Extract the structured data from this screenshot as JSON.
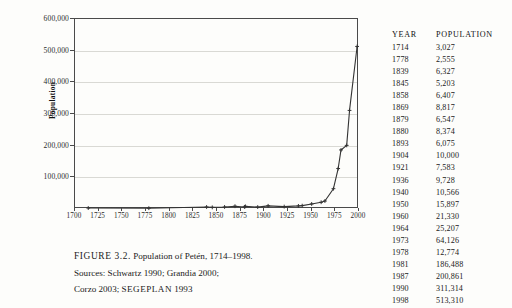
{
  "figure": {
    "caption_figno": "FIGURE 3.2.",
    "caption_title": "Population of Petén, 1714–1998.",
    "caption_line2": "Sources: Schwartz 1990; Grandia 2000;",
    "caption_line3_a": "Corzo 2003; ",
    "caption_line3_b": "SEGEPLAN",
    "caption_line3_c": " 1993"
  },
  "table": {
    "header_year": "YEAR",
    "header_population": "POPULATION",
    "rows": [
      {
        "year": "1714",
        "population": "3,027"
      },
      {
        "year": "1778",
        "population": "2,555"
      },
      {
        "year": "1839",
        "population": "6,327"
      },
      {
        "year": "1845",
        "population": "5,203"
      },
      {
        "year": "1858",
        "population": "6,407"
      },
      {
        "year": "1869",
        "population": "8,817"
      },
      {
        "year": "1879",
        "population": "6,547"
      },
      {
        "year": "1880",
        "population": "8,374"
      },
      {
        "year": "1893",
        "population": "6,075"
      },
      {
        "year": "1904",
        "population": "10,000"
      },
      {
        "year": "1921",
        "population": "7,583"
      },
      {
        "year": "1936",
        "population": "9,728"
      },
      {
        "year": "1940",
        "population": "10,566"
      },
      {
        "year": "1950",
        "population": "15,897"
      },
      {
        "year": "1960",
        "population": "21,330"
      },
      {
        "year": "1964",
        "population": "25,207"
      },
      {
        "year": "1973",
        "population": "64,126"
      },
      {
        "year": "1978",
        "population": "12,774"
      },
      {
        "year": "1981",
        "population": "186,488"
      },
      {
        "year": "1987",
        "population": "200,861"
      },
      {
        "year": "1990",
        "population": "311,314"
      },
      {
        "year": "1998",
        "population": "513,310"
      }
    ]
  },
  "chart_data": {
    "type": "line",
    "title": "Population of Petén, 1714–1998",
    "xlabel": "",
    "ylabel": "Population",
    "xlim": [
      1700,
      2000
    ],
    "ylim": [
      0,
      600000
    ],
    "grid": true,
    "legend": "none",
    "marker": "plus",
    "line_color": "#333333",
    "grid_color": "#d9d9d4",
    "xticks": [
      1700,
      1725,
      1750,
      1775,
      1800,
      1825,
      1850,
      1875,
      1900,
      1925,
      1950,
      1975,
      2000
    ],
    "xtick_labels": [
      "1700",
      "1725",
      "1750",
      "1775",
      "1800",
      "1825",
      "1850",
      "1875",
      "1900",
      "1925",
      "1950",
      "1975",
      "2000"
    ],
    "yticks": [
      100000,
      200000,
      300000,
      400000,
      500000,
      600000
    ],
    "ytick_labels": [
      "100,000",
      "200,000",
      "300,000",
      "400,000",
      "500,000",
      "600,000"
    ],
    "x": [
      1714,
      1778,
      1839,
      1845,
      1858,
      1869,
      1879,
      1880,
      1893,
      1904,
      1921,
      1936,
      1940,
      1950,
      1960,
      1964,
      1973,
      1978,
      1981,
      1987,
      1990,
      1998
    ],
    "y": [
      3027,
      2555,
      6327,
      5203,
      6407,
      8817,
      6547,
      8374,
      6075,
      10000,
      7583,
      9728,
      10566,
      15897,
      21330,
      25207,
      64126,
      127774,
      186488,
      200861,
      311314,
      513310
    ],
    "series": [
      {
        "name": "Population of Petén",
        "x": [
          1714,
          1778,
          1839,
          1845,
          1858,
          1869,
          1879,
          1880,
          1893,
          1904,
          1921,
          1936,
          1940,
          1950,
          1960,
          1964,
          1973,
          1978,
          1981,
          1987,
          1990,
          1998
        ],
        "values": [
          3027,
          2555,
          6327,
          5203,
          6407,
          8817,
          6547,
          8374,
          6075,
          10000,
          7583,
          9728,
          10566,
          15897,
          21330,
          25207,
          64126,
          127774,
          186488,
          200861,
          311314,
          513310
        ]
      }
    ]
  }
}
